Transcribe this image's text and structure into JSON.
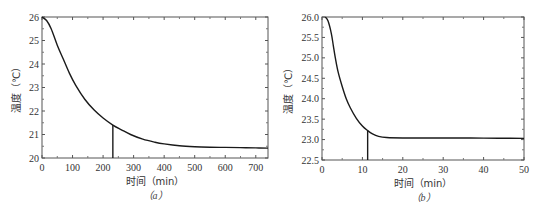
{
  "chart_data": [
    {
      "type": "line",
      "panel": "(a)",
      "caption": "（a）",
      "xlabel": "时间（min）",
      "ylabel": "温度（℃）",
      "xlim": [
        0,
        740
      ],
      "ylim": [
        20,
        26
      ],
      "xticks": [
        0,
        100,
        200,
        300,
        400,
        500,
        600,
        700
      ],
      "yticks": [
        20,
        21,
        22,
        23,
        24,
        25,
        26
      ],
      "ytick_labels": [
        "20",
        "21",
        "22",
        "23",
        "24",
        "25",
        "26"
      ],
      "grid": false,
      "series": [
        {
          "name": "temperature",
          "x": [
            0,
            15,
            30,
            50,
            70,
            90,
            110,
            140,
            170,
            200,
            232,
            260,
            290,
            330,
            370,
            400,
            450,
            500,
            550,
            600,
            650,
            700,
            740
          ],
          "y": [
            26.0,
            25.85,
            25.5,
            24.8,
            24.2,
            23.6,
            23.1,
            22.5,
            22.05,
            21.7,
            21.4,
            21.2,
            21.0,
            20.8,
            20.67,
            20.6,
            20.52,
            20.48,
            20.46,
            20.45,
            20.44,
            20.43,
            20.42
          ]
        }
      ],
      "annotations": [
        {
          "type": "vline",
          "x": 232,
          "y_from": 20,
          "y_to": 21.4
        }
      ]
    },
    {
      "type": "line",
      "panel": "(b)",
      "caption": "（b）",
      "xlabel": "时间（min）",
      "ylabel": "温度（℃）",
      "xlim": [
        0,
        50
      ],
      "ylim": [
        22.5,
        26.0
      ],
      "xticks": [
        0,
        10,
        20,
        30,
        40,
        50
      ],
      "yticks": [
        22.5,
        23.0,
        23.5,
        24.0,
        24.5,
        25.0,
        25.5,
        26.0
      ],
      "ytick_labels": [
        "22.5",
        "23.0",
        "23.5",
        "24.0",
        "24.5",
        "25.0",
        "25.5",
        "26.0"
      ],
      "grid": false,
      "series": [
        {
          "name": "temperature",
          "x": [
            0.8,
            1.5,
            2.3,
            2.8,
            3.3,
            4.0,
            5.0,
            6.0,
            7.0,
            8.5,
            10.0,
            11.3,
            12.5,
            14.0,
            16.0,
            20.0,
            30.0,
            40.0,
            50.0
          ],
          "y": [
            26.0,
            25.9,
            25.6,
            25.3,
            25.0,
            24.65,
            24.3,
            24.0,
            23.78,
            23.52,
            23.33,
            23.22,
            23.14,
            23.08,
            23.05,
            23.04,
            23.04,
            23.035,
            23.03
          ]
        }
      ],
      "annotations": [
        {
          "type": "vline",
          "x": 11.3,
          "y_from": 22.5,
          "y_to": 23.22
        }
      ]
    }
  ],
  "panels": {
    "a": {
      "caption": "（a）",
      "xlabel": "时间（min）",
      "ylabel": "温度（℃）"
    },
    "b": {
      "caption": "（b）",
      "xlabel": "时间（min）",
      "ylabel": "温度（℃）"
    }
  }
}
